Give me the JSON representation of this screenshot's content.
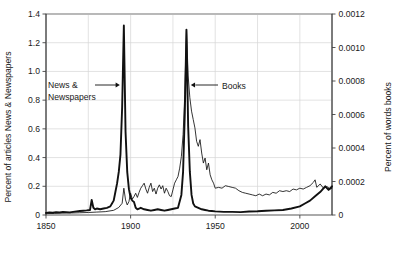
{
  "chart_data": {
    "type": "line",
    "title": "",
    "subtitle": "",
    "xlabel": "",
    "ylabel": "Percent of articles News & Newspapers",
    "ylabel_right": "Percent of words books",
    "grid": "vertical and horizontal light gridlines inside frame",
    "legend": "inline annotations with arrows",
    "xlim": [
      1850,
      2019
    ],
    "ylim": [
      0,
      1.4
    ],
    "ylim_right": [
      0,
      0.0012
    ],
    "xticks": [
      1850,
      1900,
      1950,
      2000
    ],
    "xtick_labels": [
      "1850",
      "1900",
      "1950",
      "2000"
    ],
    "yticks": [
      0,
      0.2,
      0.4,
      0.6,
      0.8,
      1.0,
      1.2,
      1.4
    ],
    "ytick_labels": [
      "0",
      "0.2",
      "0.4",
      "0.6",
      "0.8",
      "1.0",
      "1.2",
      "1.4"
    ],
    "yticks_right": [
      0,
      0.0002,
      0.0004,
      0.0006,
      0.0008,
      0.001,
      0.0012
    ],
    "ytick_labels_right": [
      "0",
      "0.0002",
      "0.0004",
      "0.0006",
      "0.0008",
      "0.0010",
      "0.0012"
    ],
    "annotations": [
      {
        "text": "News &",
        "text2": "Newspapers",
        "arrow": "right",
        "target_year": 1896
      },
      {
        "text": "Books",
        "arrow": "left",
        "target_year": 1935
      }
    ],
    "series": [
      {
        "name": "News & Newspapers",
        "axis": "left",
        "style": "thick",
        "x": [
          1850,
          1852,
          1854,
          1856,
          1858,
          1860,
          1862,
          1864,
          1866,
          1868,
          1870,
          1872,
          1874,
          1876,
          1877,
          1878,
          1879,
          1880,
          1882,
          1884,
          1886,
          1888,
          1889,
          1890,
          1891,
          1892,
          1893,
          1894,
          1895,
          1896,
          1897,
          1898,
          1899,
          1900,
          1901,
          1902,
          1903,
          1904,
          1905,
          1906,
          1907,
          1908,
          1910,
          1912,
          1914,
          1916,
          1918,
          1920,
          1922,
          1924,
          1926,
          1928,
          1930,
          1931,
          1932,
          1933,
          1934,
          1935,
          1936,
          1937,
          1938,
          1940,
          1942,
          1944,
          1946,
          1948,
          1950,
          1955,
          1960,
          1965,
          1970,
          1975,
          1980,
          1985,
          1990,
          1995,
          2000,
          2003,
          2006,
          2009,
          2012,
          2015,
          2017,
          2019
        ],
        "values": [
          0.015,
          0.018,
          0.016,
          0.02,
          0.018,
          0.022,
          0.02,
          0.018,
          0.022,
          0.025,
          0.028,
          0.03,
          0.032,
          0.035,
          0.105,
          0.05,
          0.04,
          0.045,
          0.04,
          0.045,
          0.05,
          0.06,
          0.08,
          0.1,
          0.16,
          0.22,
          0.3,
          0.42,
          0.75,
          1.32,
          0.58,
          0.3,
          0.18,
          0.12,
          0.1,
          0.09,
          0.05,
          0.04,
          0.045,
          0.05,
          0.045,
          0.04,
          0.035,
          0.03,
          0.035,
          0.04,
          0.035,
          0.03,
          0.035,
          0.04,
          0.045,
          0.05,
          0.14,
          0.3,
          0.7,
          1.29,
          0.62,
          0.3,
          0.14,
          0.08,
          0.06,
          0.05,
          0.04,
          0.035,
          0.03,
          0.028,
          0.025,
          0.022,
          0.022,
          0.02,
          0.024,
          0.026,
          0.03,
          0.032,
          0.035,
          0.045,
          0.06,
          0.08,
          0.1,
          0.13,
          0.16,
          0.2,
          0.175,
          0.2
        ]
      },
      {
        "name": "Books",
        "axis": "right",
        "style": "thin",
        "x": [
          1850,
          1855,
          1860,
          1865,
          1870,
          1875,
          1880,
          1885,
          1890,
          1893,
          1895,
          1896,
          1897,
          1898,
          1899,
          1900,
          1901,
          1902,
          1903,
          1904,
          1905,
          1906,
          1907,
          1908,
          1909,
          1910,
          1911,
          1912,
          1913,
          1914,
          1915,
          1916,
          1917,
          1918,
          1919,
          1920,
          1921,
          1922,
          1923,
          1924,
          1925,
          1926,
          1927,
          1928,
          1929,
          1930,
          1931,
          1932,
          1933,
          1934,
          1935,
          1936,
          1937,
          1938,
          1939,
          1940,
          1941,
          1942,
          1943,
          1944,
          1945,
          1946,
          1947,
          1948,
          1949,
          1950,
          1952,
          1954,
          1956,
          1958,
          1960,
          1962,
          1964,
          1966,
          1968,
          1970,
          1972,
          1974,
          1976,
          1978,
          1980,
          1982,
          1984,
          1986,
          1988,
          1990,
          1992,
          1994,
          1996,
          1998,
          2000,
          2002,
          2004,
          2006,
          2008,
          2009,
          2010,
          2012,
          2014,
          2016,
          2018,
          2019
        ],
        "values_right": [
          8.5e-06,
          9.5e-06,
          1.1e-05,
          1.2e-05,
          1.35e-05,
          1.5e-05,
          1.75e-05,
          2e-05,
          2.8e-05,
          4.5e-05,
          7e-05,
          0.00016,
          9e-05,
          6e-05,
          8e-05,
          0.00013,
          9.5e-05,
          0.00011,
          0.00013,
          0.000105,
          0.000135,
          0.00016,
          0.000175,
          0.00019,
          0.000155,
          0.00013,
          0.000165,
          0.00019,
          0.00014,
          0.00016,
          0.000125,
          0.00016,
          0.00018,
          0.000155,
          0.000175,
          0.00013,
          0.00016,
          0.00014,
          0.000115,
          0.00011,
          0.00015,
          0.00019,
          0.00021,
          0.00023,
          0.00028,
          0.00035,
          0.00048,
          0.00072,
          0.00111,
          0.00083,
          0.0007,
          0.00062,
          0.00057,
          0.00052,
          0.00044,
          0.00041,
          0.00045,
          0.00037,
          0.00031,
          0.00034,
          0.00027,
          0.00031,
          0.00024,
          0.00021,
          0.00019,
          0.00016,
          0.000165,
          0.00016,
          0.000175,
          0.00017,
          0.000165,
          0.00016,
          0.000145,
          0.000135,
          0.00013,
          0.000125,
          0.00012,
          0.000115,
          0.000125,
          0.000115,
          0.000125,
          0.00012,
          0.000135,
          0.00013,
          0.000145,
          0.00014,
          0.000145,
          0.00014,
          0.000155,
          0.00015,
          0.00016,
          0.000155,
          0.000165,
          0.000175,
          0.000195,
          0.00021,
          0.000165,
          0.000185,
          0.00016,
          0.00017,
          0.000155,
          0.00016
        ]
      }
    ]
  }
}
